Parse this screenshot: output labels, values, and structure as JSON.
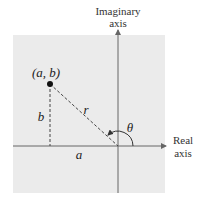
{
  "diagram": {
    "y_axis_label_line1": "Imaginary",
    "y_axis_label_line2": "axis",
    "x_axis_label_line1": "Real",
    "x_axis_label_line2": "axis",
    "point_label": "(a, b)",
    "vertical_label": "b",
    "horizontal_label": "a",
    "radius_label": "r",
    "angle_label": "θ",
    "colors": {
      "background": "#ebebeb",
      "axis": "#666666",
      "point": "#111111"
    }
  }
}
